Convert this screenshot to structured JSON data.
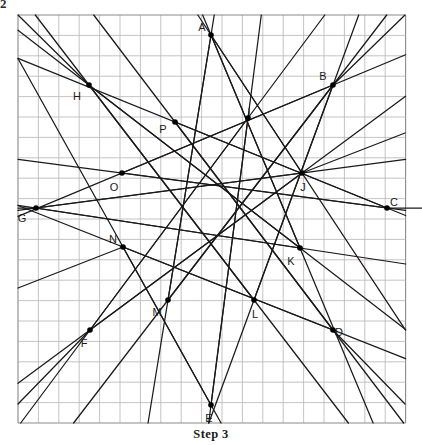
{
  "caption": {
    "text": "Step 3"
  },
  "corner_mark": {
    "text": "2"
  },
  "figure": {
    "colors": {
      "grid_line": "#b9b3b5",
      "grid_border": "#8d8789",
      "construction_line": "#1a1a1a",
      "vertex_dot": "#000000",
      "background": "#ffffff"
    },
    "grid": {
      "x0": 18,
      "y0": 15,
      "cols": 19,
      "rows": 20,
      "cell": 20.4,
      "show_grid": true
    },
    "center": {
      "x": 211,
      "y": 208
    },
    "outer_points": [
      {
        "label": "A",
        "x": 211,
        "y": 35,
        "lx": 202,
        "ly": 28
      },
      {
        "label": "B",
        "x": 333,
        "y": 85,
        "lx": 323,
        "ly": 77
      },
      {
        "label": "C",
        "x": 387,
        "y": 208,
        "lx": 394,
        "ly": 203
      },
      {
        "label": "D",
        "x": 333,
        "y": 330,
        "lx": 339,
        "ly": 333
      },
      {
        "label": "E",
        "x": 211,
        "y": 405,
        "lx": 209,
        "ly": 419
      },
      {
        "label": "F",
        "x": 90,
        "y": 330,
        "lx": 84,
        "ly": 344
      },
      {
        "label": "G",
        "x": 36,
        "y": 208,
        "lx": 22,
        "ly": 219
      },
      {
        "label": "H",
        "x": 89,
        "y": 85,
        "lx": 77,
        "ly": 97
      }
    ],
    "inner_points": [
      {
        "label": "I",
        "x": 248,
        "y": 118,
        "lx": 249,
        "ly": 113
      },
      {
        "label": "J",
        "x": 302,
        "y": 173,
        "lx": 303,
        "ly": 188
      },
      {
        "label": "K",
        "x": 300,
        "y": 248,
        "lx": 291,
        "ly": 262
      },
      {
        "label": "L",
        "x": 254,
        "y": 300,
        "lx": 255,
        "ly": 315
      },
      {
        "label": "M",
        "x": 168,
        "y": 300,
        "lx": 157,
        "ly": 313
      },
      {
        "label": "N",
        "x": 123,
        "y": 247,
        "lx": 113,
        "ly": 240
      },
      {
        "label": "O",
        "x": 122,
        "y": 173,
        "lx": 114,
        "ly": 188
      },
      {
        "label": "P",
        "x": 175,
        "y": 122,
        "lx": 163,
        "ly": 130
      }
    ],
    "segments": [
      {
        "name": "A-to-K",
        "from": "A",
        "to": "K"
      },
      {
        "name": "A-to-M",
        "from": "A",
        "to": "M"
      },
      {
        "name": "B-to-M",
        "from": "B",
        "to": "M"
      },
      {
        "name": "B-to-O",
        "from": "B",
        "to": "O"
      },
      {
        "name": "C-to-O",
        "from": "C",
        "to": "O"
      },
      {
        "name": "C-to-P",
        "from": "C",
        "to": "P"
      },
      {
        "name": "D-to-P",
        "from": "D",
        "to": "P"
      },
      {
        "name": "D-to-N",
        "from": "D",
        "to": "N"
      },
      {
        "name": "E-to-N",
        "from": "E",
        "to": "N"
      },
      {
        "name": "E-to-I",
        "from": "E",
        "to": "I"
      },
      {
        "name": "F-to-I",
        "from": "F",
        "to": "I"
      },
      {
        "name": "F-to-J",
        "from": "F",
        "to": "J"
      },
      {
        "name": "G-to-J",
        "from": "G",
        "to": "J"
      },
      {
        "name": "G-to-K",
        "from": "G",
        "to": "K"
      },
      {
        "name": "H-to-K",
        "from": "H",
        "to": "K"
      },
      {
        "name": "H-to-L",
        "from": "H",
        "to": "L"
      },
      {
        "name": "B-to-L",
        "from": "B",
        "to": "L"
      },
      {
        "name": "A-to-J",
        "from": "A",
        "to": "J"
      }
    ],
    "extended_rays": [
      {
        "name": "ray-H-upper-left",
        "x1": 89,
        "y1": 85,
        "x2": 18,
        "y2": 15
      },
      {
        "name": "ray-B-upper-right",
        "x1": 333,
        "y1": 85,
        "x2": 405,
        "y2": 15
      },
      {
        "name": "ray-F-lower-left",
        "x1": 90,
        "y1": 330,
        "x2": 18,
        "y2": 404
      },
      {
        "name": "ray-D-lower-right",
        "x1": 333,
        "y1": 330,
        "x2": 405,
        "y2": 404
      },
      {
        "name": "ray-G-left-horizontal",
        "x1": 36,
        "y1": 208,
        "x2": 18,
        "y2": 208
      },
      {
        "name": "ray-C-right-horizontal",
        "x1": 387,
        "y1": 208,
        "x2": 422,
        "y2": 208
      },
      {
        "name": "ray-N-left-down",
        "x1": 123,
        "y1": 247,
        "x2": 18,
        "y2": 288
      },
      {
        "name": "ray-J-right-up",
        "x1": 302,
        "y1": 173,
        "x2": 405,
        "y2": 133
      }
    ]
  }
}
